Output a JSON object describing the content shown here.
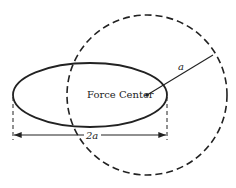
{
  "diagram": {
    "center_label": "Force Center",
    "radius_label": "a",
    "dimension_label": "2a",
    "colors": {
      "stroke": "#222222",
      "background": "#ffffff"
    },
    "shapes": {
      "ellipse": {
        "cx": 90,
        "cy": 95,
        "rx": 77,
        "ry": 32,
        "style": "solid"
      },
      "circle": {
        "cx": 147,
        "cy": 95,
        "r": 80,
        "style": "dashed"
      },
      "radius_line": {
        "x1": 147,
        "y1": 95,
        "x2": 213,
        "y2": 55
      },
      "dimension_line": {
        "x1": 13,
        "x2": 167,
        "y": 135
      }
    }
  }
}
